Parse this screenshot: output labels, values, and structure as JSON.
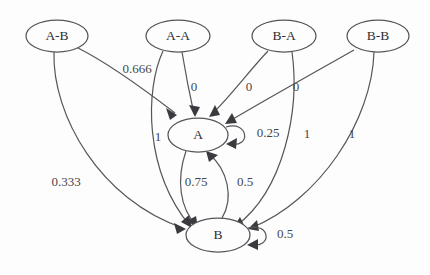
{
  "diagram": {
    "type": "state-transition-graph",
    "background_color": "#fdfdfd",
    "stroke_color": "#55565a",
    "text_color": "#2f3033",
    "nodes": [
      {
        "id": "A-B",
        "label": "A-B",
        "cx": 57,
        "cy": 36,
        "rx": 31,
        "ry": 16
      },
      {
        "id": "A-A",
        "label": "A-A",
        "cx": 178,
        "cy": 36,
        "rx": 32,
        "ry": 16
      },
      {
        "id": "B-A",
        "label": "B-A",
        "cx": 284,
        "cy": 36,
        "rx": 32,
        "ry": 16
      },
      {
        "id": "B-B",
        "label": "B-B",
        "cx": 378,
        "cy": 36,
        "rx": 31,
        "ry": 16
      },
      {
        "id": "A",
        "label": "A",
        "cx": 198,
        "cy": 135,
        "rx": 30,
        "ry": 17
      },
      {
        "id": "B",
        "label": "B",
        "cx": 218,
        "cy": 235,
        "rx": 32,
        "ry": 17
      }
    ],
    "edges": [
      {
        "from": "A-B",
        "to": "A",
        "label": "0.666",
        "label_x": 137,
        "label_y": 70
      },
      {
        "from": "A-B",
        "to": "B",
        "label": "0.333",
        "label_x": 66,
        "label_y": 183
      },
      {
        "from": "A-A",
        "to": "A",
        "label": "0",
        "label_x": 194,
        "label_y": 88
      },
      {
        "from": "A-A",
        "to": "B",
        "label": "1",
        "label_x": 158,
        "label_y": 138
      },
      {
        "from": "B-A",
        "to": "A",
        "label": "0",
        "label_x": 249,
        "label_y": 88
      },
      {
        "from": "B-A",
        "to": "B",
        "label": "1",
        "label_x": 307,
        "label_y": 135
      },
      {
        "from": "B-B",
        "to": "A",
        "label": "0",
        "label_x": 296,
        "label_y": 88
      },
      {
        "from": "B-B",
        "to": "B",
        "label": "1",
        "label_x": 352,
        "label_y": 135
      },
      {
        "from": "A",
        "to": "B",
        "label": "0.75",
        "label_x": 196,
        "label_y": 183
      },
      {
        "from": "B",
        "to": "A",
        "label": "0.5",
        "label_x": 245,
        "label_y": 183
      },
      {
        "from": "A",
        "to": "A",
        "label": "0.25",
        "label_x": 268,
        "label_y": 134
      },
      {
        "from": "B",
        "to": "B",
        "label": "0.5",
        "label_x": 285,
        "label_y": 235
      }
    ]
  }
}
